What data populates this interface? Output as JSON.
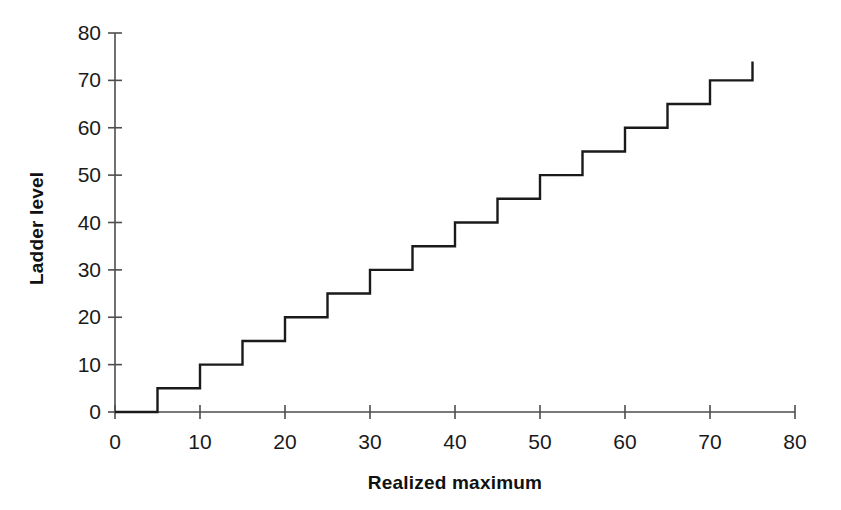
{
  "chart_data": {
    "type": "line",
    "subtype": "step",
    "title": "",
    "xlabel": "Realized maximum",
    "ylabel": "Ladder level",
    "xlim": [
      0,
      80
    ],
    "ylim": [
      0,
      80
    ],
    "xticks": [
      0,
      10,
      20,
      30,
      40,
      50,
      60,
      70,
      80
    ],
    "yticks": [
      0,
      10,
      20,
      30,
      40,
      50,
      60,
      70,
      80
    ],
    "xtick_labels": [
      "0",
      "10",
      "20",
      "30",
      "40",
      "50",
      "60",
      "70",
      "80"
    ],
    "ytick_labels": [
      "0",
      "10",
      "20",
      "30",
      "40",
      "50",
      "60",
      "70",
      "80"
    ],
    "grid": false,
    "legend": false,
    "legend_position": "none",
    "line_color": "#1a1a1a",
    "line_width": 2.4,
    "axis_color": "#4d4d4d",
    "background": "#ffffff",
    "series": [
      {
        "name": "Ladder level",
        "step_mode": "post",
        "x": [
          0,
          5,
          10,
          15,
          20,
          25,
          30,
          35,
          40,
          45,
          50,
          55,
          60,
          65,
          70,
          75
        ],
        "y": [
          0,
          5,
          10,
          15,
          20,
          25,
          30,
          35,
          40,
          45,
          50,
          55,
          60,
          65,
          70,
          74
        ],
        "final_riser": {
          "x": 75,
          "from": 70,
          "to": 74
        },
        "points": [
          {
            "x_from": 0,
            "x_to": 5,
            "level": 0
          },
          {
            "x_from": 5,
            "x_to": 10,
            "level": 5
          },
          {
            "x_from": 10,
            "x_to": 15,
            "level": 10
          },
          {
            "x_from": 15,
            "x_to": 20,
            "level": 15
          },
          {
            "x_from": 20,
            "x_to": 25,
            "level": 20
          },
          {
            "x_from": 25,
            "x_to": 30,
            "level": 25
          },
          {
            "x_from": 30,
            "x_to": 35,
            "level": 30
          },
          {
            "x_from": 35,
            "x_to": 40,
            "level": 35
          },
          {
            "x_from": 40,
            "x_to": 45,
            "level": 40
          },
          {
            "x_from": 45,
            "x_to": 50,
            "level": 45
          },
          {
            "x_from": 50,
            "x_to": 55,
            "level": 50
          },
          {
            "x_from": 55,
            "x_to": 60,
            "level": 55
          },
          {
            "x_from": 60,
            "x_to": 65,
            "level": 60
          },
          {
            "x_from": 65,
            "x_to": 70,
            "level": 65
          },
          {
            "x_from": 70,
            "x_to": 75,
            "level": 70
          }
        ]
      }
    ]
  },
  "axes": {
    "y_title": "Ladder level",
    "x_title": "Realized maximum",
    "y_labels": [
      "0",
      "10",
      "20",
      "30",
      "40",
      "50",
      "60",
      "70",
      "80"
    ],
    "x_labels": [
      "0",
      "10",
      "20",
      "30",
      "40",
      "50",
      "60",
      "70",
      "80"
    ]
  }
}
